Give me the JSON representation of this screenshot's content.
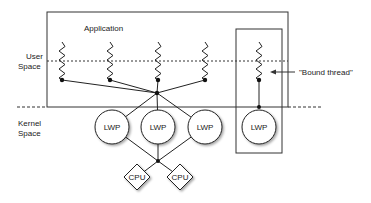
{
  "diagram": {
    "application_label": "Application",
    "user_space_label": [
      "User",
      "Space"
    ],
    "kernel_space_label": [
      "Kernel",
      "Space"
    ],
    "bound_thread_label": "\"Bound thread\"",
    "threads": [
      {
        "id": "t1",
        "bound": false
      },
      {
        "id": "t2",
        "bound": false
      },
      {
        "id": "t3",
        "bound": false
      },
      {
        "id": "t4",
        "bound": false
      },
      {
        "id": "t5",
        "bound": true
      }
    ],
    "lwps": [
      {
        "id": "lwp1",
        "label": "LWP"
      },
      {
        "id": "lwp2",
        "label": "LWP"
      },
      {
        "id": "lwp3",
        "label": "LWP"
      },
      {
        "id": "lwp4",
        "label": "LWP"
      }
    ],
    "cpus": [
      {
        "id": "cpu1",
        "label": "CPU"
      },
      {
        "id": "cpu2",
        "label": "CPU"
      }
    ],
    "edges": [
      [
        "t1",
        "mux"
      ],
      [
        "t2",
        "mux"
      ],
      [
        "t3",
        "mux"
      ],
      [
        "t4",
        "mux"
      ],
      [
        "mux",
        "lwp1"
      ],
      [
        "mux",
        "lwp2"
      ],
      [
        "mux",
        "lwp3"
      ],
      [
        "lwp1",
        "cpumux"
      ],
      [
        "lwp2",
        "cpumux"
      ],
      [
        "lwp3",
        "cpumux"
      ],
      [
        "cpumux",
        "cpu1"
      ],
      [
        "cpumux",
        "cpu2"
      ],
      [
        "t5",
        "lwp4"
      ]
    ]
  }
}
